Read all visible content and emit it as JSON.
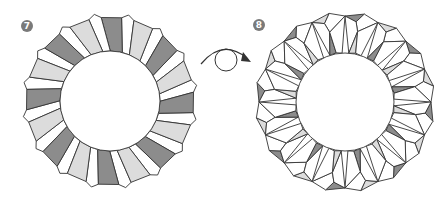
{
  "steps": [
    {
      "number": "7",
      "badge": {
        "x": 21,
        "y": 20
      },
      "ring": {
        "type": "flat-rectangles",
        "center": [
          110,
          101
        ],
        "outer_radius": 86,
        "inner_radius": 50,
        "units": 16,
        "rotation_deg": -6
      }
    },
    {
      "number": "8",
      "badge": {
        "x": 253,
        "y": 19
      },
      "ring": {
        "type": "folded-triangles",
        "center": [
          345,
          102
        ],
        "outer_radius": 90,
        "inner_radius": 49,
        "units": 16,
        "rotation_deg": 0
      }
    }
  ],
  "arrow": {
    "type": "turn-over",
    "label": "turn over"
  },
  "colors": {
    "outline": "#333333",
    "dark_fill": "#8c8c8c",
    "light_fill": "#dcdcdc",
    "white_fill": "#ffffff",
    "badge": "#7a7a7a"
  }
}
